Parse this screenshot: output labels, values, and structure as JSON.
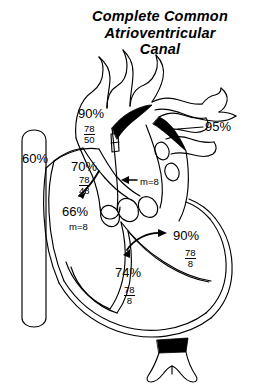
{
  "figure": {
    "title_lines": [
      "Complete Common",
      "Atrioventricular",
      "Canal"
    ],
    "type": "cardiac-catheterization-diagram",
    "ink_color": "#000000",
    "background_color": "#ffffff"
  },
  "labels": {
    "aorta_saturation": "90%",
    "aorta_pressure_systolic": "78",
    "aorta_pressure_diastolic": "50",
    "pulmonary_vein_saturation": "95%",
    "pulmonary_artery_saturation": "70%",
    "pulmonary_artery_pressure_systolic": "78",
    "pulmonary_artery_pressure_diastolic": "48",
    "pulmonary_artery_mean": "m=8",
    "vena_cava_saturation": "60%",
    "right_atrium_saturation": "66%",
    "right_atrium_mean": "m=8",
    "left_ventricle_saturation": "90%",
    "left_ventricle_pressure_systolic": "78",
    "left_ventricle_pressure_diastolic": "8",
    "right_ventricle_saturation": "74%",
    "right_ventricle_pressure_systolic": "78",
    "right_ventricle_pressure_diastolic": "8"
  }
}
